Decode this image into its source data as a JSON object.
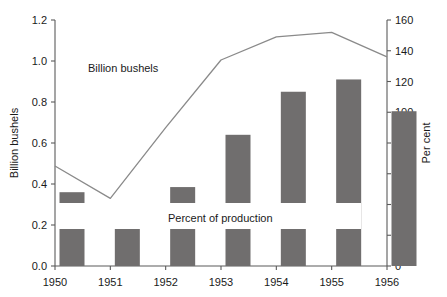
{
  "chart_data": {
    "type": "bar",
    "title": "",
    "subtitle": "",
    "xlabel": "",
    "ylabel": "Billion bushels",
    "y2label": "Per cent",
    "categories": [
      "1950",
      "1951",
      "1952",
      "1953",
      "1954",
      "1955",
      "1956"
    ],
    "x": [
      1950,
      1951,
      1952,
      1953,
      1954,
      1955,
      1956
    ],
    "ylim": [
      0.0,
      1.2
    ],
    "y2lim": [
      0,
      160
    ],
    "yticks": [
      "0.0",
      "0.2",
      "0.4",
      "0.6",
      "0.8",
      "1.0",
      "1.2"
    ],
    "ytick_values": [
      0.0,
      0.2,
      0.4,
      0.6,
      0.8,
      1.0,
      1.2
    ],
    "y2ticks": [
      "0",
      "20",
      "40",
      "60",
      "80",
      "100",
      "120",
      "140",
      "160"
    ],
    "y2tick_values": [
      0,
      20,
      40,
      60,
      80,
      100,
      120,
      140,
      160
    ],
    "xticks": [
      "1950",
      "1951",
      "1952",
      "1953",
      "1954",
      "1955",
      "1956"
    ],
    "grid": false,
    "legend": "none",
    "series": [
      {
        "name": "Billion bushels",
        "type": "bar",
        "axis": "left",
        "unit": "billion bushels",
        "color": "#706e6e",
        "categories": [
          "1950",
          "1951",
          "1952",
          "1953",
          "1954",
          "1955",
          "1956"
        ],
        "values": [
          0.36,
          0.25,
          0.385,
          0.64,
          0.85,
          0.91,
          0.755
        ]
      },
      {
        "name": "Percent of production",
        "type": "line",
        "axis": "right",
        "unit": "per cent",
        "color": "#8a8a8a",
        "x": [
          1950,
          1951,
          1952,
          1953,
          1954,
          1955,
          1956
        ],
        "values": [
          65,
          44,
          90,
          134,
          149,
          152,
          136
        ]
      }
    ],
    "annotations": [
      {
        "text": "Billion bushels",
        "x": 1950.6,
        "y": 1.02,
        "axis": "left"
      },
      {
        "text": "Percent of production",
        "x": 1952.6,
        "y": 0.23,
        "axis": "left"
      }
    ]
  },
  "axes": {
    "left_title": "Billion bushels",
    "right_title": "Per cent"
  },
  "annotations": {
    "bar_label": "Billion bushels",
    "line_label": "Percent of production"
  },
  "colors": {
    "bar_fill": "#706e6e",
    "line_stroke": "#8a8a8a",
    "axis": "#5b5b5b",
    "text": "#1a1a1a",
    "background": "#ffffff"
  }
}
